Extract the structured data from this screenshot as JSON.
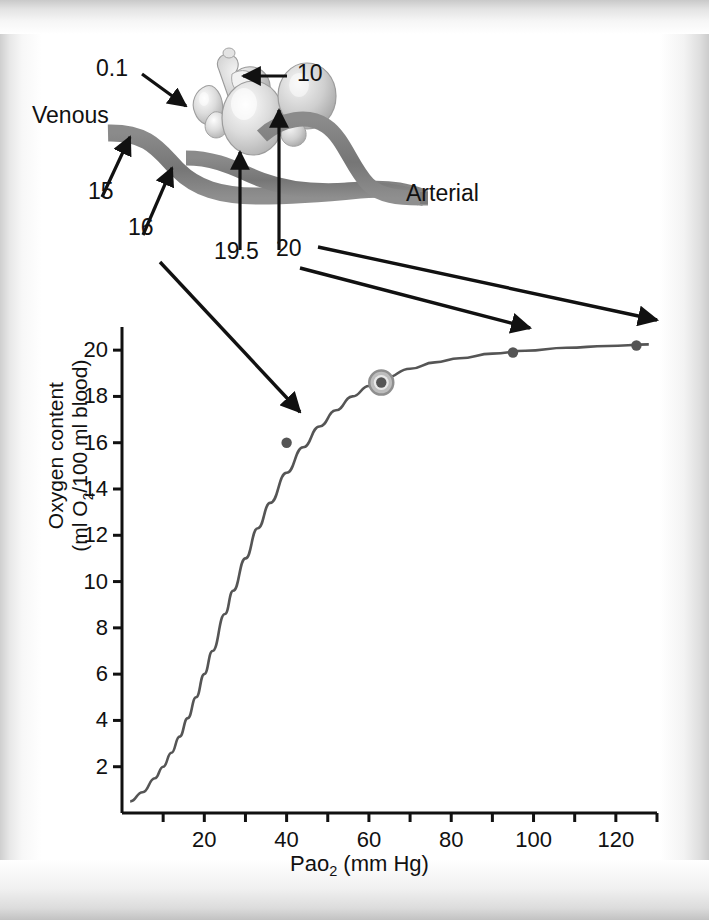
{
  "figure": {
    "kind": "oxygen-content-dissociation-curve-with-alveoli-diagram",
    "diagram": {
      "venous_label": "Venous",
      "arterial_label": "Arterial",
      "callouts": [
        {
          "name": "alveolar-po2-low",
          "value": "0.1"
        },
        {
          "name": "alveolar-po2-high",
          "value": "10"
        },
        {
          "name": "venous-content-15",
          "value": "15"
        },
        {
          "name": "venous-content-16",
          "value": "16"
        },
        {
          "name": "capillary-content-19-5",
          "value": "19.5"
        },
        {
          "name": "arterial-content-20",
          "value": "20"
        }
      ]
    }
  },
  "chart_data": {
    "type": "line",
    "title": "",
    "xlabel_text": "Pao",
    "xlabel_sub": "2",
    "xlabel_unit": " (mm Hg)",
    "ylabel_line1": "Oxygen content",
    "ylabel_line2_a": "(ml O",
    "ylabel_line2_sub": "2",
    "ylabel_line2_b": "/100 ml blood)",
    "xlim": [
      0,
      130
    ],
    "ylim": [
      0,
      21
    ],
    "grid": false,
    "legend": "none",
    "x_tick_interval": 10,
    "x_labeled_ticks": [
      20,
      40,
      60,
      80,
      100,
      120
    ],
    "x_all_ticks": [
      10,
      20,
      30,
      40,
      50,
      60,
      70,
      80,
      90,
      100,
      110,
      120,
      130
    ],
    "y_ticks": [
      2,
      4,
      6,
      8,
      10,
      12,
      14,
      16,
      18,
      20
    ],
    "curve": {
      "name": "oxyhemoglobin-content-curve",
      "x": [
        2,
        5,
        8,
        10,
        12,
        14,
        16,
        18,
        20,
        22,
        25,
        27,
        30,
        33,
        36,
        40,
        44,
        48,
        52,
        56,
        60,
        64,
        70,
        76,
        82,
        90,
        98,
        108,
        118,
        128
      ],
      "y": [
        0.5,
        0.9,
        1.5,
        2.0,
        2.6,
        3.3,
        4.1,
        5.0,
        6.0,
        7.0,
        8.6,
        9.6,
        11.0,
        12.3,
        13.4,
        14.7,
        15.8,
        16.7,
        17.4,
        18.0,
        18.45,
        18.8,
        19.2,
        19.47,
        19.65,
        19.85,
        19.97,
        20.1,
        20.18,
        20.25
      ]
    },
    "points": [
      {
        "name": "venous-point",
        "x": 40,
        "y": 16.0,
        "label": "16",
        "highlight": false
      },
      {
        "name": "mixed-point",
        "x": 63,
        "y": 18.6,
        "label": "",
        "highlight": true
      },
      {
        "name": "capillary-point",
        "x": 95,
        "y": 19.9,
        "label": "19.5",
        "highlight": false
      },
      {
        "name": "arterial-point",
        "x": 125,
        "y": 20.2,
        "label": "20",
        "highlight": false
      }
    ],
    "annotations": [
      {
        "name": "annotation-16",
        "text": "16",
        "points_to": "venous-point"
      },
      {
        "name": "annotation-19-5",
        "text": "19.5",
        "points_to": "capillary-point"
      },
      {
        "name": "annotation-20",
        "text": "20",
        "points_to": "arterial-point"
      }
    ]
  },
  "colors": {
    "ink": "#111111",
    "curve": "#555555",
    "vessel": "#7b7b7b",
    "alveoli": "#c8c8c8",
    "point": "#555555",
    "highlight_ring": "#9a9a9a",
    "page": "#ffffff"
  }
}
